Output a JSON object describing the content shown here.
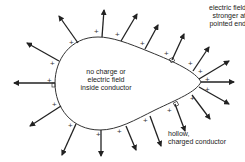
{
  "diagram": {
    "labels": {
      "center": [
        "no charge or",
        "electric field",
        "inside conductor"
      ],
      "tip": [
        "electric field",
        "stronger at",
        "pointed end"
      ],
      "hollow": [
        "hollow,",
        "charged conductor"
      ]
    },
    "charge_symbol": "+",
    "colors": {
      "outline": "#333333",
      "arrow": "#222222",
      "text": "#222222"
    }
  }
}
